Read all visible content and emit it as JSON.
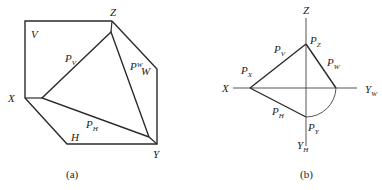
{
  "figure_a": {
    "caption": "(a)",
    "labels": {
      "V": "V",
      "Z": "Z",
      "X": "X",
      "Y": "Y",
      "H": "H",
      "W": "W",
      "PV_main": "P",
      "PV_sub": "V",
      "PW_main": "P",
      "PW_sub": "W",
      "PH_main": "P",
      "PH_sub": "H"
    }
  },
  "figure_b": {
    "caption": "(b)",
    "labels": {
      "Z": "Z",
      "X": "X",
      "YW_main": "Y",
      "YW_sub": "W",
      "YH_main": "Y",
      "YH_sub": "H",
      "PZ_main": "P",
      "PZ_sub": "Z",
      "PV_main": "P",
      "PV_sub": "V",
      "PX_main": "P",
      "PX_sub": "X",
      "PW_main": "P",
      "PW_sub": "W",
      "PH_main": "P",
      "PH_sub": "H",
      "PY_main": "P",
      "PY_sub": "Y"
    }
  },
  "colors": {
    "line": "#2a2a2a",
    "thin": "#555555"
  }
}
